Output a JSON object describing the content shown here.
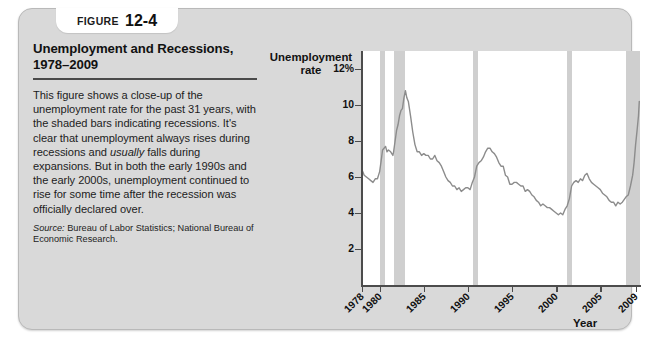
{
  "figure": {
    "label_word": "Figure",
    "number": "12-4",
    "title": "Unemployment and Recessions,\n1978–2009",
    "body_part1": "This figure shows a close-up of the unemployment rate for the past 31 years, with the shaded bars indicating recessions. It's clear that unemployment always rises during recessions and ",
    "body_emphasis": "usually",
    "body_part2": " falls during expansions. But in both the early 1990s and the early 2000s, unemployment continued to rise for some time after the recession was officially declared over.",
    "source_label": "Source:",
    "source_text": " Bureau of Labor Statistics; National Bureau of Economic Research."
  },
  "colors": {
    "card_background": "#d9d9d9",
    "plot_background": "#ffffff",
    "recession_bar": "#cfcfcf",
    "series_line": "#8c8c8c",
    "axis": "#4c4c4c",
    "text": "#111111",
    "rule": "#4a4a4a"
  },
  "chart_data": {
    "type": "line",
    "title": "Unemployment and Recessions, 1978–2009",
    "xlabel": "Year",
    "ylabel": "Unemployment rate",
    "xlim": [
      1978,
      2009.5
    ],
    "ylim": [
      0,
      13
    ],
    "grid": false,
    "legend": "none",
    "ytick_labels": [
      "12%",
      "10",
      "8",
      "6",
      "4",
      "2"
    ],
    "ytick_values": [
      12,
      10,
      8,
      6,
      4,
      2
    ],
    "xtick_labels": [
      "1978",
      "1980",
      "1985",
      "1990",
      "1995",
      "2000",
      "2005",
      "2009"
    ],
    "xtick_values": [
      1978,
      1980,
      1985,
      1990,
      1995,
      2000,
      2005,
      2009
    ],
    "series": [
      {
        "name": "Unemployment rate",
        "x": [
          1978.0,
          1978.25,
          1978.5,
          1978.75,
          1979.0,
          1979.25,
          1979.5,
          1979.75,
          1980.0,
          1980.17,
          1980.33,
          1980.5,
          1980.67,
          1980.83,
          1981.0,
          1981.25,
          1981.5,
          1981.58,
          1981.75,
          1981.92,
          1982.08,
          1982.25,
          1982.42,
          1982.58,
          1982.75,
          1982.92,
          1983.08,
          1983.25,
          1983.5,
          1983.75,
          1984.0,
          1984.25,
          1984.5,
          1984.75,
          1985.0,
          1985.25,
          1985.5,
          1985.75,
          1986.0,
          1986.25,
          1986.5,
          1986.75,
          1987.0,
          1987.25,
          1987.5,
          1987.75,
          1988.0,
          1988.25,
          1988.5,
          1988.75,
          1989.0,
          1989.25,
          1989.5,
          1989.75,
          1990.0,
          1990.25,
          1990.5,
          1990.75,
          1991.0,
          1991.25,
          1991.5,
          1991.75,
          1992.0,
          1992.25,
          1992.5,
          1992.75,
          1993.0,
          1993.25,
          1993.5,
          1993.75,
          1994.0,
          1994.25,
          1994.5,
          1994.75,
          1995.0,
          1995.25,
          1995.5,
          1995.75,
          1996.0,
          1996.25,
          1996.5,
          1996.75,
          1997.0,
          1997.25,
          1997.5,
          1997.75,
          1998.0,
          1998.25,
          1998.5,
          1998.75,
          1999.0,
          1999.25,
          1999.5,
          1999.75,
          2000.0,
          2000.25,
          2000.5,
          2000.75,
          2001.0,
          2001.25,
          2001.5,
          2001.75,
          2002.0,
          2002.25,
          2002.5,
          2002.75,
          2003.0,
          2003.25,
          2003.5,
          2003.75,
          2004.0,
          2004.25,
          2004.5,
          2004.75,
          2005.0,
          2005.25,
          2005.5,
          2005.75,
          2006.0,
          2006.25,
          2006.5,
          2006.75,
          2007.0,
          2007.25,
          2007.5,
          2007.92,
          2008.17,
          2008.42,
          2008.67,
          2008.83,
          2009.0,
          2009.17,
          2009.33,
          2009.42
        ],
        "y": [
          6.4,
          6.1,
          6.0,
          5.9,
          5.8,
          5.7,
          5.9,
          5.9,
          6.3,
          6.9,
          7.5,
          7.6,
          7.7,
          7.4,
          7.5,
          7.4,
          7.2,
          7.4,
          8.0,
          8.6,
          8.9,
          9.4,
          9.7,
          9.8,
          10.4,
          10.8,
          10.4,
          10.2,
          9.4,
          8.5,
          7.8,
          7.4,
          7.4,
          7.2,
          7.3,
          7.2,
          7.2,
          7.0,
          7.0,
          7.2,
          6.9,
          6.8,
          6.6,
          6.3,
          6.0,
          5.8,
          5.7,
          5.5,
          5.5,
          5.3,
          5.4,
          5.2,
          5.3,
          5.4,
          5.4,
          5.3,
          5.7,
          6.0,
          6.6,
          6.8,
          6.9,
          7.1,
          7.4,
          7.6,
          7.6,
          7.4,
          7.3,
          7.1,
          6.8,
          6.6,
          6.6,
          6.1,
          6.0,
          5.6,
          5.6,
          5.7,
          5.7,
          5.6,
          5.5,
          5.5,
          5.2,
          5.3,
          5.2,
          5.0,
          4.9,
          4.7,
          4.6,
          4.4,
          4.5,
          4.4,
          4.3,
          4.3,
          4.2,
          4.1,
          4.0,
          3.9,
          4.0,
          3.9,
          4.2,
          4.4,
          4.8,
          5.5,
          5.7,
          5.8,
          5.7,
          5.9,
          5.8,
          6.1,
          6.2,
          5.9,
          5.7,
          5.6,
          5.5,
          5.4,
          5.3,
          5.1,
          5.0,
          4.9,
          4.7,
          4.6,
          4.6,
          4.4,
          4.6,
          4.5,
          4.6,
          4.9,
          5.0,
          5.5,
          6.1,
          6.8,
          7.8,
          8.6,
          9.4,
          10.2
        ]
      }
    ],
    "recessions": [
      {
        "name": "1980 recession",
        "start": 1980.0,
        "end": 1980.58
      },
      {
        "name": "1981–82 recession",
        "start": 1981.58,
        "end": 1982.92
      },
      {
        "name": "1990–91 recession",
        "start": 1990.58,
        "end": 1991.17
      },
      {
        "name": "2001 recession",
        "start": 2001.25,
        "end": 2001.83
      },
      {
        "name": "2007–09 recession",
        "start": 2007.92,
        "end": 2009.5
      }
    ]
  }
}
